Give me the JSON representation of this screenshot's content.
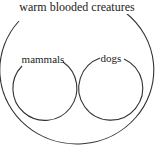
{
  "diagram": {
    "type": "euler",
    "stroke_color": "#333333",
    "background": "#ffffff",
    "outer": {
      "label": "warm blooded creatures",
      "cx": 78,
      "cy": 76,
      "rx": 77,
      "ry": 74
    },
    "inner": [
      {
        "label": "mammals",
        "cx": 45,
        "cy": 89,
        "r": 32
      },
      {
        "label": "dogs",
        "cx": 112,
        "cy": 88,
        "r": 32
      }
    ]
  }
}
